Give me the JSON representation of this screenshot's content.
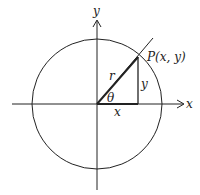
{
  "diagram": {
    "axes": {
      "x_label": "x",
      "y_label": "y"
    },
    "circle": {
      "radius_label": "r"
    },
    "point": {
      "label": "P(x, y)"
    },
    "angle": {
      "label": "θ"
    },
    "triangle": {
      "horizontal_leg_label": "x",
      "vertical_leg_label": "y"
    },
    "colors": {
      "stroke": "#222222",
      "background": "#ffffff"
    }
  }
}
